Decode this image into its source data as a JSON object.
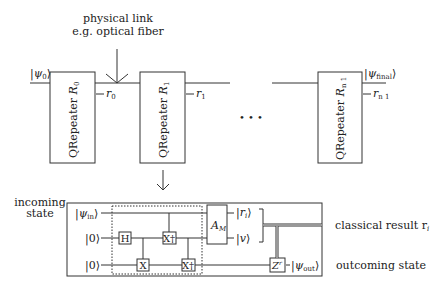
{
  "top_annotation": {
    "line1": "physical link",
    "line2": "e.g. optical fiber"
  },
  "input_state": "|ψ₀⟩",
  "output_state": "|ψ_final⟩",
  "repeaters": [
    {
      "label": "QRepeater",
      "sub": "R",
      "idx": "0",
      "result": "r",
      "result_idx": "0"
    },
    {
      "label": "QRepeater",
      "sub": "R",
      "idx": "1",
      "result": "r",
      "result_idx": "1"
    },
    {
      "label": "QRepeater",
      "sub": "R",
      "idx": "n 1",
      "result": "r",
      "result_idx": "n 1"
    }
  ],
  "ellipsis": "• • •",
  "circuit": {
    "incoming_label_1": "incoming",
    "incoming_label_2": "state",
    "wire_inputs": [
      "|ψ_in⟩",
      "|0⟩",
      "|0⟩"
    ],
    "gates": {
      "h": "H",
      "x": "X",
      "xdag1": "X†",
      "xdag2": "X†",
      "am": "A",
      "am_sub": "M",
      "z": "Z",
      "z_sup": "r"
    },
    "outputs": {
      "r": "|r",
      "r_sub": "i",
      "v": "|v⟩",
      "psi_out": "|ψ_out⟩"
    },
    "classical_result": "classical result r",
    "classical_result_sub": "i",
    "outcoming_state": "outcoming state"
  }
}
